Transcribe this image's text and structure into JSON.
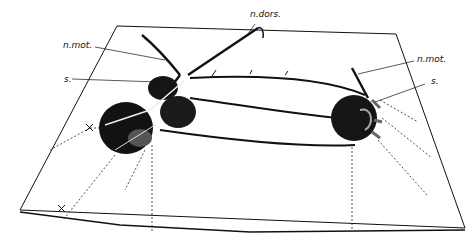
{
  "figure": {
    "labels": {
      "n_dors": "n.dors.",
      "n_mot_left": "n.mot.",
      "s_left": "s.",
      "n_mot_right": "n.mot.",
      "s_right": "s."
    },
    "colors": {
      "ink": "#111111",
      "paper": "#ffffff"
    }
  }
}
